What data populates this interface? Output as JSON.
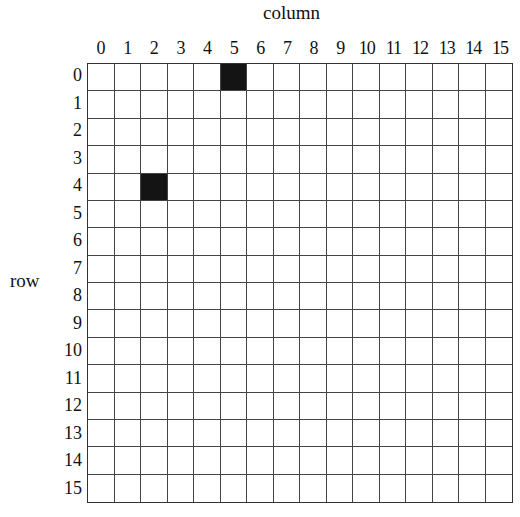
{
  "labels": {
    "column_title": "column",
    "row_title": "row"
  },
  "columns": [
    "0",
    "1",
    "2",
    "3",
    "4",
    "5",
    "6",
    "7",
    "8",
    "9",
    "10",
    "11",
    "12",
    "13",
    "14",
    "15"
  ],
  "rows": [
    "0",
    "1",
    "2",
    "3",
    "4",
    "5",
    "6",
    "7",
    "8",
    "9",
    "10",
    "11",
    "12",
    "13",
    "14",
    "15"
  ],
  "grid": {
    "size": [
      16,
      16
    ],
    "filled_cells": [
      {
        "row": 0,
        "col": 5
      },
      {
        "row": 4,
        "col": 2
      }
    ],
    "fill_color": "#141414",
    "empty_color": "#ffffff",
    "line_color": "#444444"
  }
}
